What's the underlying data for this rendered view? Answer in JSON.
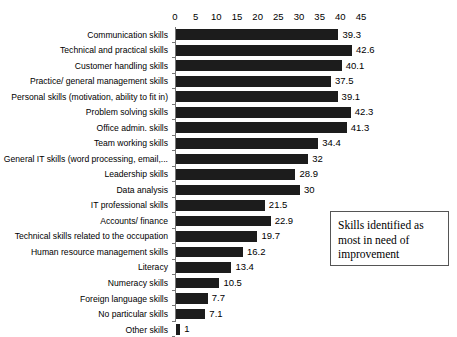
{
  "chart_data": {
    "type": "bar",
    "orientation": "horizontal",
    "title": "",
    "xlabel": "",
    "ylabel": "",
    "xlim": [
      0,
      45
    ],
    "xticks": [
      0,
      5,
      10,
      15,
      20,
      25,
      30,
      35,
      40,
      45
    ],
    "grid": false,
    "legend": null,
    "bar_color": "#1c1c1c",
    "annotation": "Skills identified as most in need of improvement",
    "annotation_lines": [
      "Skills identified as",
      "most in need of",
      "improvement"
    ],
    "categories": [
      "Communication skills",
      "Technical and practical skills",
      "Customer handling skills",
      "Practice/ general management skills",
      "Personal skills (motivation, ability to fit in)",
      "Problem solving skills",
      "Office admin. skills",
      "Team working skills",
      "General IT skills (word processing, email,...",
      "Leadership skills",
      "Data analysis",
      "IT professional skills",
      "Accounts/ finance",
      "Technical skills related to the occupation",
      "Human resource management skills",
      "Literacy",
      "Numeracy skills",
      "Foreign language skills",
      "No particular skills",
      "Other skills"
    ],
    "values": [
      39.3,
      42.6,
      40.1,
      37.5,
      39.1,
      42.3,
      41.3,
      34.4,
      32,
      28.9,
      30,
      21.5,
      22.9,
      19.7,
      16.2,
      13.4,
      10.5,
      7.7,
      7.1,
      1
    ],
    "value_labels": [
      "39.3",
      "42.6",
      "40.1",
      "37.5",
      "39.1",
      "42.3",
      "41.3",
      "34.4",
      "32",
      "28.9",
      "30",
      "21.5",
      "22.9",
      "19.7",
      "16.2",
      "13.4",
      "10.5",
      "7.7",
      "7.1",
      "1"
    ]
  }
}
